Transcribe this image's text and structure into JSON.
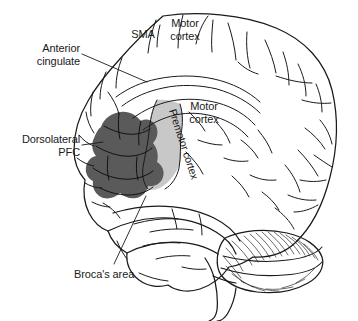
{
  "figure": {
    "background_color": "#ffffff",
    "outline_color": "#1a1a1a",
    "shade_dark_color": "#5a5a5a",
    "shade_light_color": "#c8c8c8"
  },
  "labels": {
    "anterior_cingulate": "Anterior\ncingulate",
    "dorsolateral_pfc": "Dorsolateral\nPFC",
    "brocas_area": "Broca's area",
    "sma": "SMA",
    "motor_cortex_top": "Motor\ncortex",
    "motor_cortex_mid": "Motor\ncortex",
    "premotor_cortex": "Premotor cortex"
  },
  "regions": [
    {
      "name": "dorsolateral-prefrontal-cortex",
      "label": "Dorsolateral PFC",
      "shading": "dark-gray",
      "color": "#5a5a5a"
    },
    {
      "name": "premotor-cortex",
      "label": "Premotor cortex",
      "shading": "light-gray",
      "color": "#c8c8c8"
    },
    {
      "name": "supplementary-motor-area",
      "label": "SMA",
      "shading": "none",
      "color": "#ffffff"
    },
    {
      "name": "motor-cortex",
      "label": "Motor cortex",
      "shading": "none",
      "color": "#ffffff"
    },
    {
      "name": "anterior-cingulate",
      "label": "Anterior cingulate",
      "shading": "none",
      "color": "#ffffff"
    },
    {
      "name": "brocas-area",
      "label": "Broca's area",
      "shading": "none",
      "color": "#ffffff"
    },
    {
      "name": "cerebellum",
      "label": "Cerebellum",
      "shading": "hatched",
      "color": "#ffffff"
    }
  ]
}
